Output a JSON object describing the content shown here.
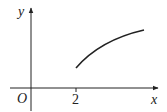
{
  "diagram": {
    "type": "function-graph",
    "axes": {
      "x_label": "x",
      "y_label": "y",
      "origin_label": "O"
    },
    "ticks": [
      {
        "axis": "x",
        "label": "2"
      }
    ],
    "curve": {
      "description": "increasing concave curve starting at x = 2",
      "start_x": 2
    },
    "colors": {
      "stroke": "#222222",
      "background": "#ffffff"
    }
  }
}
